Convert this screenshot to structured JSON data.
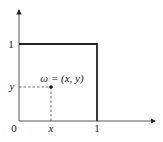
{
  "diagram": {
    "axes": {
      "origin_label": "0",
      "x_tick_labels": [
        "x",
        "1"
      ],
      "y_tick_labels": [
        "1",
        "y"
      ]
    },
    "point": {
      "label": "ω = (x, y)"
    },
    "shape": "unit-square",
    "colors": {
      "stroke": "#222222",
      "background": "#ffffff"
    }
  }
}
